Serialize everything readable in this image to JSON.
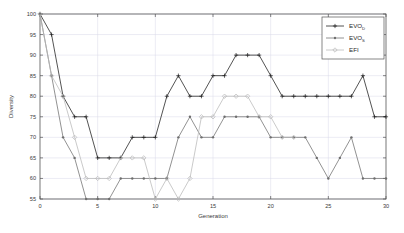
{
  "chart_data": {
    "type": "line",
    "title": "",
    "xlabel": "Generation",
    "ylabel": "Diversity",
    "xlim": [
      0,
      30
    ],
    "ylim": [
      55,
      100
    ],
    "xticks": [
      0,
      5,
      10,
      15,
      20,
      25,
      30
    ],
    "yticks": [
      55,
      60,
      65,
      70,
      75,
      80,
      85,
      90,
      95,
      100
    ],
    "grid": true,
    "legend_position": "top-right",
    "series": [
      {
        "name": "EVO_D",
        "legend_base": "EVO",
        "legend_subscript": "D",
        "color": "#1a1a1a",
        "marker": "plus",
        "x": [
          0,
          1,
          2,
          3,
          4,
          5,
          6,
          7,
          8,
          9,
          10,
          11,
          12,
          13,
          14,
          15,
          16,
          17,
          18,
          19,
          20,
          21,
          22,
          23,
          24,
          25,
          26,
          27,
          28,
          29,
          30
        ],
        "values": [
          100,
          95,
          80,
          75,
          75,
          65,
          65,
          65,
          70,
          70,
          70,
          80,
          85,
          80,
          80,
          85,
          85,
          90,
          90,
          90,
          85,
          80,
          80,
          80,
          80,
          80,
          80,
          80,
          85,
          75,
          75
        ]
      },
      {
        "name": "EVO_S",
        "legend_base": "EVO",
        "legend_subscript": "S",
        "color": "#6e6e6e",
        "marker": "dot",
        "x": [
          0,
          1,
          2,
          3,
          4,
          5,
          6,
          7,
          8,
          9,
          10,
          11,
          12,
          13,
          14,
          15,
          16,
          17,
          18,
          19,
          20,
          21,
          22,
          23,
          24,
          25,
          26,
          27,
          28,
          29,
          30
        ],
        "values": [
          100,
          85,
          70,
          65,
          55,
          55,
          55,
          60,
          60,
          60,
          60,
          60,
          70,
          75,
          70,
          70,
          75,
          75,
          75,
          75,
          70,
          70,
          70,
          70,
          65,
          60,
          65,
          70,
          60,
          60,
          60
        ]
      },
      {
        "name": "EFI",
        "legend_base": "EFI",
        "legend_subscript": "",
        "color": "#b8b8b8",
        "marker": "diamond",
        "x": [
          0,
          1,
          2,
          3,
          4,
          5,
          6,
          7,
          8,
          9,
          10,
          11,
          12,
          13,
          14,
          15,
          16,
          17,
          18,
          19,
          20,
          21,
          22
        ],
        "values": [
          100,
          85,
          80,
          70,
          60,
          60,
          60,
          65,
          65,
          65,
          55,
          60,
          55,
          60,
          75,
          75,
          80,
          80,
          80,
          75,
          75,
          70,
          70
        ]
      }
    ]
  },
  "legend": {
    "entries": [
      {
        "base": "EVO",
        "sub": "D"
      },
      {
        "base": "EVO",
        "sub": "S"
      },
      {
        "base": "EFI",
        "sub": ""
      }
    ]
  },
  "axes": {
    "ylabel": "Diversity",
    "xlabel": "Generation",
    "xtick_labels": [
      "0",
      "5",
      "10",
      "15",
      "20",
      "25",
      "30"
    ],
    "ytick_labels": [
      "55",
      "60",
      "65",
      "70",
      "75",
      "80",
      "85",
      "90",
      "95",
      "100"
    ]
  },
  "colors": {
    "series_1": "#1a1a1a",
    "series_2": "#6e6e6e",
    "series_3": "#b8b8b8",
    "grid": "#d8d8e8",
    "axis": "#555555",
    "background": "#ffffff"
  }
}
